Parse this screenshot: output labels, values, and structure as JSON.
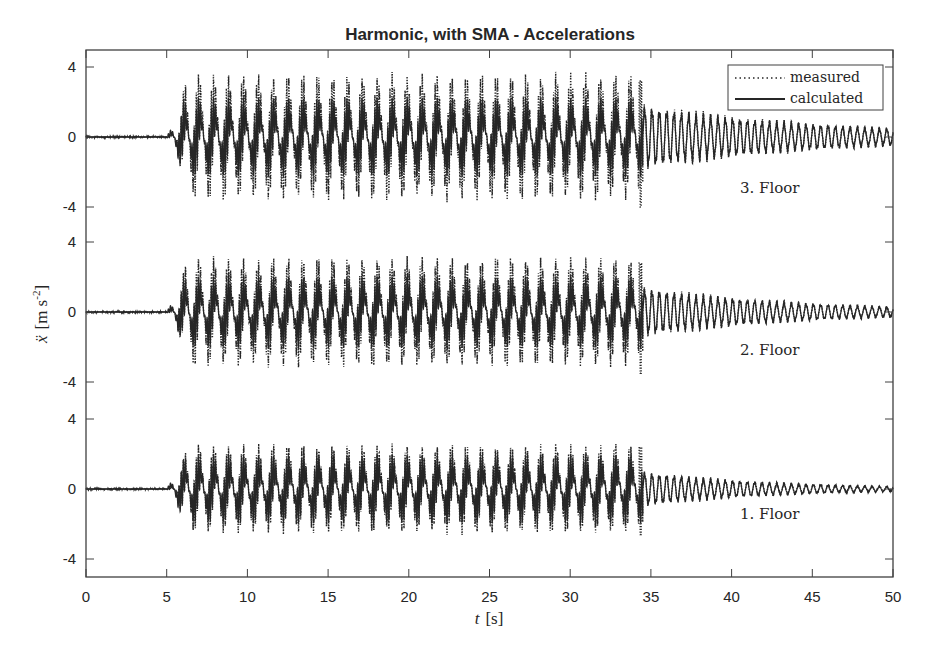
{
  "chart_data": {
    "type": "line",
    "title": "Harmonic, with SMA - Accelerations",
    "xlabel": "t [s]",
    "xlabel_var": "t",
    "xlabel_unit": "[s]",
    "ylabel": "ẍ [m s^-2]",
    "ylabel_var": "ẍ",
    "ylabel_unit": "[m s",
    "ylabel_exp": "-2",
    "ylabel_close": "]",
    "xlim": [
      0,
      50
    ],
    "x_ticks": [
      0,
      5,
      10,
      15,
      20,
      25,
      30,
      35,
      40,
      45,
      50
    ],
    "x_tick_labels": [
      "0",
      "5",
      "10",
      "15",
      "20",
      "25",
      "30",
      "35",
      "40",
      "45",
      "50"
    ],
    "grid": false,
    "legend": {
      "position": "upper right",
      "entries": [
        {
          "label": "measured",
          "style": "dotted"
        },
        {
          "label": "calculated",
          "style": "solid"
        }
      ]
    },
    "panels": [
      {
        "name": "3. Floor",
        "ylim": [
          -5,
          5
        ],
        "y_ticks": [
          4,
          0,
          -4
        ],
        "y_tick_labels": [
          "4",
          "0",
          "-4"
        ],
        "excitation_start_s": 5.0,
        "excitation_end_s": 34.5,
        "forced_cycles_approx": 32,
        "forced_amplitude_calculated": 2.2,
        "forced_amplitude_measured_peak": 3.7,
        "end_spike_measured": [
          3.2,
          -4.0
        ],
        "free_decay_amplitude_start": 1.8,
        "free_decay_amplitude_end": 0.5,
        "free_decay_frequency_hz": 2.2
      },
      {
        "name": "2. Floor",
        "ylim": [
          -5,
          5
        ],
        "y_ticks": [
          4,
          0,
          -4
        ],
        "y_tick_labels": [
          "4",
          "0",
          "-4"
        ],
        "excitation_start_s": 5.0,
        "excitation_end_s": 34.5,
        "forced_cycles_approx": 32,
        "forced_amplitude_calculated": 2.0,
        "forced_amplitude_measured_peak": 3.2,
        "end_spike_measured": [
          2.8,
          -3.5
        ],
        "free_decay_amplitude_start": 1.4,
        "free_decay_amplitude_end": 0.3,
        "free_decay_frequency_hz": 2.2
      },
      {
        "name": "1. Floor",
        "ylim": [
          -5,
          5
        ],
        "y_ticks": [
          4,
          0,
          -4
        ],
        "y_tick_labels": [
          "4",
          "0",
          "-4"
        ],
        "excitation_start_s": 5.0,
        "excitation_end_s": 34.5,
        "forced_cycles_approx": 32,
        "forced_amplitude_calculated": 1.9,
        "forced_amplitude_measured_peak": 2.6,
        "end_spike_measured": [
          2.4,
          -2.6
        ],
        "free_decay_amplitude_start": 1.0,
        "free_decay_amplitude_end": 0.15,
        "free_decay_frequency_hz": 2.2
      }
    ]
  },
  "style": {
    "line_color": "#262626",
    "axis_color": "#404040",
    "background": "#ffffff"
  }
}
